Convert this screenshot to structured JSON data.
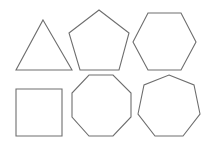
{
  "diagram": {
    "background": "#ffffff",
    "stroke_color": "#6e6e6e",
    "shapes": [
      {
        "name": "triangle",
        "sides": 3,
        "points": "43,20 72,70 16,70"
      },
      {
        "name": "pentagon",
        "sides": 5,
        "points": "99,10 129,33 119,70 80,70 69,33"
      },
      {
        "name": "hexagon",
        "sides": 6,
        "points": "148,13 181,13 196,42 181,70 148,70 133,42"
      },
      {
        "name": "square",
        "sides": 4,
        "points": "16,89 62,89 62,136 16,136"
      },
      {
        "name": "octagon",
        "sides": 8,
        "points": "89,75 113,75 131,93 131,117 113,136 89,136 72,117 72,93"
      },
      {
        "name": "heptagon",
        "sides": 7,
        "points": "169,75 194,85 200,114 183,136 155,136 138,114 144,85"
      }
    ]
  }
}
